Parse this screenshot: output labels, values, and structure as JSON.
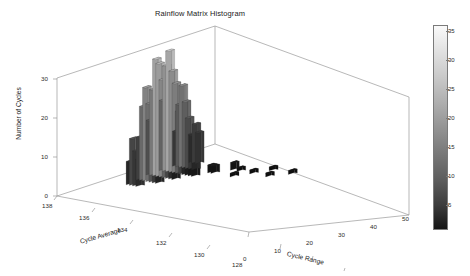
{
  "figure": {
    "title": "Rainflow Matrix Histogram",
    "background": "#ffffff"
  },
  "chart_data": {
    "type": "bar",
    "subtype": "3d-histogram",
    "title": "Rainflow Matrix Histogram",
    "xlabel": "Cycle Range",
    "ylabel": "Cycle Average",
    "zlabel": "Number of Cycles",
    "xlim": [
      -5,
      55
    ],
    "ylim": [
      127,
      139
    ],
    "zlim": [
      0,
      33
    ],
    "xticks": [
      0,
      10,
      20,
      30,
      40,
      50
    ],
    "yticks": [
      138,
      136,
      134,
      132,
      130,
      128
    ],
    "zticks": [
      0,
      10,
      20,
      30
    ],
    "grid": false,
    "colormap": "gray",
    "colorbar": {
      "ticks": [
        5,
        10,
        15,
        20,
        25,
        30,
        35
      ],
      "min": 0,
      "max": 37,
      "orientation": "vertical",
      "position": "right"
    },
    "note": "Counts of rainflow-extracted cycles binned by cycle range (x) and cycle average (y); bar height and grayscale shade both encode the number of cycles.",
    "bars": [
      {
        "range": 0,
        "average": 133,
        "count": 14
      },
      {
        "range": 0,
        "average": 132,
        "count": 18
      },
      {
        "range": 0,
        "average": 131,
        "count": 9
      },
      {
        "range": 1,
        "average": 134,
        "count": 11
      },
      {
        "range": 1,
        "average": 133,
        "count": 22
      },
      {
        "range": 1,
        "average": 132,
        "count": 27
      },
      {
        "range": 1,
        "average": 131,
        "count": 16
      },
      {
        "range": 1,
        "average": 130,
        "count": 7
      },
      {
        "range": 2,
        "average": 135,
        "count": 6
      },
      {
        "range": 2,
        "average": 134,
        "count": 19
      },
      {
        "range": 2,
        "average": 133,
        "count": 30
      },
      {
        "range": 2,
        "average": 132,
        "count": 31
      },
      {
        "range": 2,
        "average": 131,
        "count": 21
      },
      {
        "range": 2,
        "average": 130,
        "count": 10
      },
      {
        "range": 3,
        "average": 135,
        "count": 12
      },
      {
        "range": 3,
        "average": 134,
        "count": 24
      },
      {
        "range": 3,
        "average": 133,
        "count": 29
      },
      {
        "range": 3,
        "average": 132,
        "count": 26
      },
      {
        "range": 3,
        "average": 131,
        "count": 17
      },
      {
        "range": 3,
        "average": 130,
        "count": 8
      },
      {
        "range": 4,
        "average": 135,
        "count": 9
      },
      {
        "range": 4,
        "average": 134,
        "count": 20
      },
      {
        "range": 4,
        "average": 133,
        "count": 25
      },
      {
        "range": 4,
        "average": 132,
        "count": 23
      },
      {
        "range": 4,
        "average": 131,
        "count": 13
      },
      {
        "range": 5,
        "average": 135,
        "count": 7
      },
      {
        "range": 5,
        "average": 134,
        "count": 15
      },
      {
        "range": 5,
        "average": 133,
        "count": 18
      },
      {
        "range": 5,
        "average": 132,
        "count": 16
      },
      {
        "range": 5,
        "average": 131,
        "count": 9
      },
      {
        "range": 6,
        "average": 134,
        "count": 10
      },
      {
        "range": 6,
        "average": 133,
        "count": 12
      },
      {
        "range": 6,
        "average": 132,
        "count": 11
      },
      {
        "range": 6,
        "average": 131,
        "count": 6
      },
      {
        "range": 7,
        "average": 134,
        "count": 5
      },
      {
        "range": 7,
        "average": 133,
        "count": 7
      },
      {
        "range": 7,
        "average": 132,
        "count": 6
      },
      {
        "range": 8,
        "average": 133,
        "count": 4
      },
      {
        "range": 8,
        "average": 132,
        "count": 4
      },
      {
        "range": 9,
        "average": 132,
        "count": 3
      },
      {
        "range": 10,
        "average": 132,
        "count": 3
      },
      {
        "range": 11,
        "average": 131,
        "count": 2
      },
      {
        "range": 12,
        "average": 131,
        "count": 2
      },
      {
        "range": 14,
        "average": 130,
        "count": 2
      },
      {
        "range": 16,
        "average": 130,
        "count": 1
      },
      {
        "range": 18,
        "average": 131,
        "count": 1
      },
      {
        "range": 20,
        "average": 130,
        "count": 1
      },
      {
        "range": 22,
        "average": 129,
        "count": 1
      },
      {
        "range": 25,
        "average": 130,
        "count": 1
      },
      {
        "range": 28,
        "average": 129,
        "count": 1
      }
    ]
  },
  "axes": {
    "y_title": "Number of Cycles",
    "y_ticks": [
      "30",
      "20",
      "10",
      "0"
    ],
    "cycle_average_title": "Cycle Average",
    "cycle_average_ticks": [
      "138",
      "136",
      "134",
      "132",
      "130",
      "128"
    ],
    "cycle_range_title": "Cycle Range",
    "cycle_range_ticks": [
      "0",
      "10",
      "20",
      "30",
      "40",
      "50"
    ]
  },
  "colorbar": {
    "ticks": [
      "35",
      "30",
      "25",
      "20",
      "15",
      "10",
      "5"
    ]
  }
}
